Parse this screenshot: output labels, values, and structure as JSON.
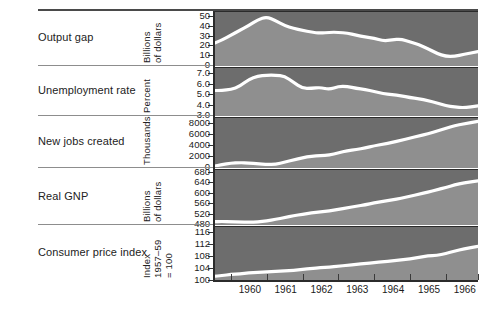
{
  "figure": {
    "title": "",
    "x_axis": {
      "tick_labels": [
        "1960",
        "1961",
        "1962",
        "1963",
        "1964",
        "1965",
        "1966"
      ],
      "range": [
        1959.5,
        1966.9
      ]
    }
  },
  "chart_data": [
    {
      "type": "area",
      "title": "Output gap",
      "ylabel": "Billions of dollars",
      "xlabel": "",
      "ylim": [
        0,
        55
      ],
      "yticks": [
        0,
        10,
        20,
        30,
        40,
        50
      ],
      "ytick_labels": [
        "0",
        "10",
        "20",
        "30",
        "40",
        "50"
      ],
      "grid": false,
      "legend": "none",
      "x": [
        1959.5,
        1959.75,
        1960.0,
        1960.25,
        1960.5,
        1960.75,
        1961.0,
        1961.25,
        1961.5,
        1961.75,
        1962.0,
        1962.25,
        1962.5,
        1962.75,
        1963.0,
        1963.25,
        1963.5,
        1963.75,
        1964.0,
        1964.25,
        1964.5,
        1964.75,
        1965.0,
        1965.25,
        1965.5,
        1965.75,
        1966.0,
        1966.25,
        1966.5,
        1966.9
      ],
      "values": [
        22,
        26,
        31,
        36,
        41,
        47,
        50,
        46,
        41,
        38,
        36,
        34,
        33,
        34,
        34,
        33,
        31,
        29,
        28,
        25,
        26,
        27,
        24,
        21,
        17,
        12,
        9,
        9,
        11,
        14
      ]
    },
    {
      "type": "area",
      "title": "Unemployment rate",
      "ylabel": "Percent",
      "xlabel": "",
      "ylim": [
        3.0,
        7.6
      ],
      "yticks": [
        3.0,
        4.0,
        5.0,
        6.0,
        7.0
      ],
      "ytick_labels": [
        "3.0",
        "4.0",
        "5.0",
        "6.0",
        "7.0"
      ],
      "grid": false,
      "legend": "none",
      "x": [
        1959.5,
        1959.75,
        1960.0,
        1960.25,
        1960.5,
        1960.75,
        1961.0,
        1961.25,
        1961.5,
        1961.75,
        1962.0,
        1962.25,
        1962.5,
        1962.75,
        1963.0,
        1963.25,
        1963.5,
        1963.75,
        1964.0,
        1964.25,
        1964.5,
        1964.75,
        1965.0,
        1965.25,
        1965.5,
        1965.75,
        1966.0,
        1966.25,
        1966.5,
        1966.9
      ],
      "values": [
        5.4,
        5.4,
        5.5,
        5.8,
        6.5,
        6.8,
        6.9,
        6.9,
        6.8,
        6.2,
        5.6,
        5.6,
        5.7,
        5.5,
        5.8,
        5.8,
        5.6,
        5.5,
        5.3,
        5.1,
        5.0,
        4.9,
        4.7,
        4.6,
        4.4,
        4.2,
        3.9,
        3.8,
        3.7,
        3.9
      ]
    },
    {
      "type": "area",
      "title": "New jobs created",
      "ylabel": "Thousands",
      "xlabel": "",
      "ylim": [
        0,
        9000
      ],
      "yticks": [
        0,
        2000,
        4000,
        6000,
        8000
      ],
      "ytick_labels": [
        "0",
        "2000",
        "4000",
        "6000",
        "8000"
      ],
      "grid": false,
      "legend": "none",
      "x": [
        1959.5,
        1959.75,
        1960.0,
        1960.25,
        1960.5,
        1960.75,
        1961.0,
        1961.25,
        1961.5,
        1961.75,
        1962.0,
        1962.25,
        1962.5,
        1962.75,
        1963.0,
        1963.25,
        1963.5,
        1963.75,
        1964.0,
        1964.25,
        1964.5,
        1964.75,
        1965.0,
        1965.25,
        1965.5,
        1965.75,
        1966.0,
        1966.25,
        1966.5,
        1966.9
      ],
      "values": [
        100,
        450,
        700,
        800,
        750,
        600,
        450,
        500,
        900,
        1300,
        1700,
        2000,
        2100,
        2200,
        2600,
        3000,
        3200,
        3500,
        3900,
        4200,
        4500,
        4900,
        5300,
        5700,
        6100,
        6600,
        7100,
        7600,
        7900,
        8400
      ]
    },
    {
      "type": "area",
      "title": "Real GNP",
      "ylabel": "Billions of dollars",
      "xlabel": "",
      "ylim": [
        480,
        690
      ],
      "yticks": [
        480,
        520,
        560,
        600,
        640,
        680
      ],
      "ytick_labels": [
        "480",
        "520",
        "560",
        "600",
        "640",
        "680"
      ],
      "grid": false,
      "legend": "none",
      "x": [
        1959.5,
        1959.75,
        1960.0,
        1960.25,
        1960.5,
        1960.75,
        1961.0,
        1961.25,
        1961.5,
        1961.75,
        1962.0,
        1962.25,
        1962.5,
        1962.75,
        1963.0,
        1963.25,
        1963.5,
        1963.75,
        1964.0,
        1964.25,
        1964.5,
        1964.75,
        1965.0,
        1965.25,
        1965.5,
        1965.75,
        1966.0,
        1966.25,
        1966.5,
        1966.9
      ],
      "values": [
        489,
        490,
        489,
        488,
        487,
        488,
        492,
        498,
        505,
        512,
        518,
        523,
        527,
        531,
        537,
        543,
        549,
        555,
        562,
        568,
        574,
        580,
        588,
        596,
        604,
        613,
        622,
        632,
        640,
        648
      ]
    },
    {
      "type": "area",
      "title": "Consumer price index",
      "ylabel": "Index 1957–59 = 100",
      "xlabel": "",
      "ylim": [
        100,
        118
      ],
      "yticks": [
        100,
        104,
        108,
        112,
        116
      ],
      "ytick_labels": [
        "100",
        "104",
        "108",
        "112",
        "116"
      ],
      "grid": false,
      "legend": "none",
      "x": [
        1959.5,
        1959.75,
        1960.0,
        1960.25,
        1960.5,
        1960.75,
        1961.0,
        1961.25,
        1961.5,
        1961.75,
        1962.0,
        1962.25,
        1962.5,
        1962.75,
        1963.0,
        1963.25,
        1963.5,
        1963.75,
        1964.0,
        1964.25,
        1964.5,
        1964.75,
        1965.0,
        1965.25,
        1965.5,
        1965.75,
        1966.0,
        1966.25,
        1966.5,
        1966.9
      ],
      "values": [
        101.2,
        101.5,
        101.9,
        102.1,
        102.4,
        102.6,
        102.8,
        102.9,
        103.1,
        103.3,
        103.6,
        103.9,
        104.2,
        104.4,
        104.7,
        105.0,
        105.3,
        105.6,
        105.9,
        106.2,
        106.5,
        106.8,
        107.2,
        107.7,
        108.2,
        108.3,
        109.0,
        109.8,
        110.6,
        111.4
      ]
    }
  ],
  "colors": {
    "panel_upper": "#6d6d6d",
    "panel_lower": "#8f8f8f",
    "line": "#ffffff",
    "rule": "#4a4a4a",
    "text": "#1a1a1a"
  }
}
